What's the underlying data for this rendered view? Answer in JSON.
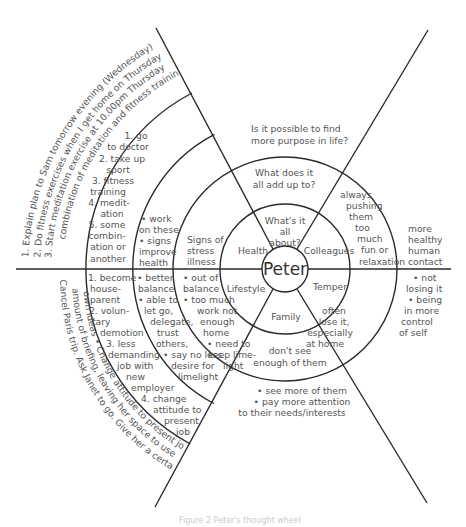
{
  "diagram": {
    "type": "concentric-wheel",
    "center": {
      "label": "Peter"
    },
    "inner_ring": {
      "top": [
        "What's it",
        "all",
        "about?"
      ],
      "upper_left": "Health",
      "upper_right": "Colleagues",
      "lower_left": "Lifestyle",
      "lower_right": "Temper",
      "bottom": "Family"
    },
    "middle_ring": {
      "top": [
        "What does it",
        "all add up to?"
      ],
      "upper_left": [
        "Signs of",
        "stress",
        "illness"
      ],
      "upper_right": [
        "always",
        "pushing",
        "them",
        "too",
        "much",
        "fun or",
        "relaxation"
      ],
      "lower_left": [
        "• out of",
        "balance",
        "• too much",
        "work not",
        "enough",
        "home",
        "• need to",
        "keep lime-",
        "light"
      ],
      "lower_right": [
        "often",
        "lose it,",
        "especially",
        "at home"
      ],
      "bottom": [
        "don't see",
        "enough of them"
      ]
    },
    "outer_ring": {
      "top": [
        "Is it possible to find",
        "more purpose in life?"
      ],
      "right_upper": [
        "more",
        "healthy",
        "human",
        "contact"
      ],
      "right_lower": [
        "• not",
        "losing it",
        "• being",
        "in more",
        "control",
        "of self"
      ],
      "bottom": [
        "• see more of them",
        "• pay more attention",
        "to their needs/interests"
      ],
      "upper_left_inner": [
        "• work",
        "on these",
        "• signs",
        "improve",
        "health"
      ],
      "lower_left_inner": [
        "• better",
        "balance",
        "• able to",
        "let go,",
        "delegate,",
        "trust",
        "others,",
        "• say no less",
        "desire for",
        "limelight"
      ],
      "upper_left_options": [
        "1. go",
        "to doctor",
        "2. take up",
        "sport",
        "3. fitness",
        "training",
        "4. medit-",
        "ation",
        "5. some",
        "combin-",
        "ation or",
        "another"
      ],
      "lower_left_options": [
        "1. become",
        "house-",
        "parent",
        "2. volun-",
        "tary",
        "demotion",
        "3. less",
        "demanding",
        "job with",
        "new",
        "employer",
        "4. change",
        "attitude to",
        "present",
        "job"
      ],
      "upper_left_actions": [
        "1. Explain plan to Sam tomorrow evening (Wednesday)",
        "2. Do fitness exercises when I get home on Thursday",
        "3. Start meditation exercise at 10.00pm Thursday",
        "combination of meditation and fitness training"
      ],
      "lower_left_actions": [
        "Cancel Paris trip. Ask Janet to go. Give her a certain",
        "amount of briefing, leaving her space to use her",
        "own ideas  •  Change attitude to present job"
      ]
    },
    "caption": "Figure 2 Peter's thought wheel"
  }
}
